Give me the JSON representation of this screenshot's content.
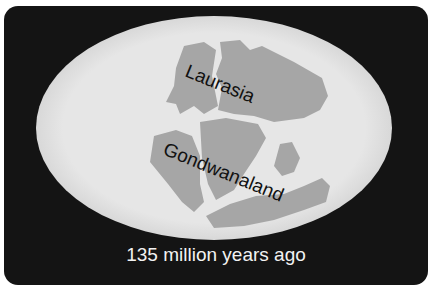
{
  "diagram": {
    "labels": {
      "north": "Laurasia",
      "south": "Gondwanaland"
    },
    "caption": "135 million years ago",
    "colors": {
      "background": "#141414",
      "ocean": "#e3e3e3",
      "land": "#a6a6a6",
      "label_text": "#111111",
      "caption_text": "#f2f2f2"
    }
  }
}
